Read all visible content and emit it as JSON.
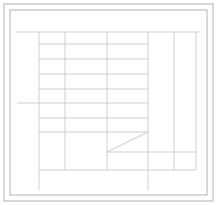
{
  "document": {
    "title": "Architectural Grid Line Drawing",
    "type": "technical-line-drawing",
    "width": 217,
    "height": 205,
    "background_color": "#ffffff"
  },
  "palette": {
    "frame_stroke": "#b8b8b8",
    "grid_stroke": "#c9c9c9",
    "diagonal_stroke": "#c4c4c4",
    "paper": "#ffffff"
  },
  "chart_data": {
    "type": "diagram",
    "xlabel": "",
    "ylabel": "",
    "xlim": [
      0,
      217
    ],
    "ylim": [
      0,
      205
    ],
    "grid": true,
    "legend": "none",
    "frames": [
      {
        "name": "outer-frame",
        "x": 4,
        "y": 4,
        "width": 209,
        "height": 197,
        "stroke": "#b8b8b8",
        "stroke_width": 1.1
      },
      {
        "name": "inner-frame",
        "x": 10,
        "y": 10,
        "width": 197,
        "height": 185,
        "stroke": "#b8b8b8",
        "stroke_width": 1.1
      }
    ],
    "horizontal_lines": [
      {
        "name": "h-top-band",
        "y": 32,
        "x1": 17,
        "x2": 199,
        "stroke_width": 0.9
      },
      {
        "name": "h-row-1",
        "y": 44,
        "x1": 39,
        "x2": 148,
        "stroke_width": 0.9
      },
      {
        "name": "h-row-2",
        "y": 59,
        "x1": 39,
        "x2": 148,
        "stroke_width": 0.9
      },
      {
        "name": "h-row-3",
        "y": 74,
        "x1": 39,
        "x2": 148,
        "stroke_width": 0.9
      },
      {
        "name": "h-row-4",
        "y": 89,
        "x1": 39,
        "x2": 148,
        "stroke_width": 0.9
      },
      {
        "name": "h-mid-band",
        "y": 103,
        "x1": 17,
        "x2": 148,
        "stroke_width": 0.9
      },
      {
        "name": "h-row-5",
        "y": 118,
        "x1": 39,
        "x2": 148,
        "stroke_width": 0.9
      },
      {
        "name": "h-row-6",
        "y": 132,
        "x1": 39,
        "x2": 148,
        "stroke_width": 0.9
      },
      {
        "name": "h-diagonal-base",
        "y": 152,
        "x1": 107,
        "x2": 196,
        "stroke_width": 0.9
      },
      {
        "name": "h-lower-band",
        "y": 170,
        "x1": 39,
        "x2": 196,
        "stroke_width": 0.9
      }
    ],
    "vertical_lines": [
      {
        "name": "v-col-1",
        "x": 39,
        "y1": 32,
        "y2": 190,
        "stroke_width": 0.9
      },
      {
        "name": "v-col-2",
        "x": 65,
        "y1": 32,
        "y2": 170,
        "stroke_width": 0.9
      },
      {
        "name": "v-col-3",
        "x": 107,
        "y1": 32,
        "y2": 170,
        "stroke_width": 0.9
      },
      {
        "name": "v-col-4",
        "x": 148,
        "y1": 32,
        "y2": 190,
        "stroke_width": 0.9
      },
      {
        "name": "v-col-5",
        "x": 174,
        "y1": 32,
        "y2": 170,
        "stroke_width": 0.9
      },
      {
        "name": "v-col-6",
        "x": 196,
        "y1": 32,
        "y2": 170,
        "stroke_width": 0.9
      }
    ],
    "diagonal_lines": [
      {
        "name": "diagonal-ramp",
        "x1": 107,
        "y1": 152,
        "x2": 148,
        "y2": 132,
        "stroke_width": 0.9
      }
    ]
  }
}
